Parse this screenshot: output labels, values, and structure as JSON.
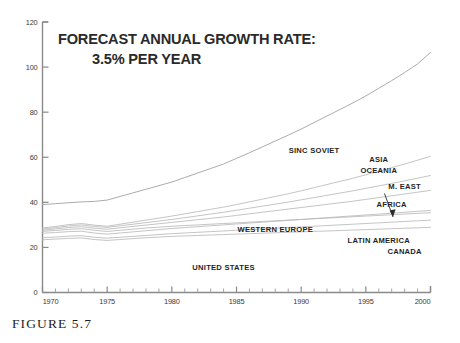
{
  "figure": {
    "caption": "FIGURE 5.7"
  },
  "chart_data": {
    "type": "line",
    "title": "FORECAST ANNUAL GROWTH RATE:",
    "subtitle": "3.5% PER YEAR",
    "xlabel": "",
    "ylabel": "",
    "xlim": [
      1970,
      2000
    ],
    "ylim": [
      0,
      120
    ],
    "grid": false,
    "legend_position": "inline-right",
    "x_ticks_major": [
      1970,
      1975,
      1980,
      1985,
      1990,
      1995,
      2000
    ],
    "x_tick_labels": [
      "1970",
      "1975",
      "1980",
      "1985",
      "1990",
      "1995",
      "2000"
    ],
    "x_minor_tick_interval": 1,
    "y_ticks_major": [
      0,
      20,
      40,
      60,
      80,
      100,
      120
    ],
    "y_tick_labels": [
      "0",
      "20",
      "40",
      "60",
      "80",
      "100",
      "120"
    ],
    "x": [
      1970,
      1971,
      1972,
      1973,
      1974,
      1975,
      1976,
      1977,
      1978,
      1979,
      1980,
      1981,
      1982,
      1983,
      1984,
      1985,
      1986,
      1987,
      1988,
      1989,
      1990,
      1991,
      1992,
      1993,
      1994,
      1995,
      1996,
      1997,
      1998,
      1999,
      2000
    ],
    "series": [
      {
        "name": "SINO SOVIET",
        "label": "SINC SOVIET",
        "values": [
          39,
          39.4,
          39.8,
          40.2,
          40.4,
          41,
          42.6,
          44.2,
          45.8,
          47.4,
          49,
          51,
          53,
          55,
          57,
          59.5,
          62,
          64.6,
          67.2,
          69.8,
          72.5,
          75.4,
          78.3,
          81.2,
          84.1,
          87.2,
          90.6,
          94,
          97.6,
          101.4,
          106.5
        ]
      },
      {
        "name": "ASIA OCEANIA",
        "label": "ASIA\nOCEANIA",
        "values": [
          28.6,
          29.3,
          30.1,
          30.6,
          29.9,
          29.4,
          30.3,
          31.2,
          32.1,
          33,
          33.9,
          34.9,
          35.9,
          36.9,
          37.9,
          39,
          40.2,
          41.4,
          42.6,
          43.8,
          45.1,
          46.5,
          47.9,
          49.3,
          50.7,
          52.2,
          53.8,
          55.4,
          57,
          58.7,
          60.4
        ]
      },
      {
        "name": "MIDDLE EAST",
        "label": "M. EAST",
        "values": [
          28.1,
          28.8,
          29.5,
          30,
          29.3,
          28.9,
          29.6,
          30.3,
          31,
          31.7,
          32.4,
          33.2,
          34,
          34.8,
          35.6,
          36.5,
          37.4,
          38.3,
          39.2,
          40.1,
          41.1,
          42.1,
          43.1,
          44.1,
          45.1,
          46.2,
          47.3,
          48.4,
          49.5,
          50.7,
          51.9
        ]
      },
      {
        "name": "AFRICA",
        "label": "AFRICA",
        "values": [
          27.6,
          28.2,
          28.8,
          29.2,
          28.5,
          28.1,
          28.7,
          29.3,
          29.9,
          30.5,
          31.1,
          31.7,
          32.3,
          32.9,
          33.5,
          34.2,
          34.9,
          35.6,
          36.3,
          37,
          37.7,
          38.4,
          39.1,
          39.8,
          40.5,
          41.3,
          42.1,
          42.9,
          43.7,
          44.5,
          45.3
        ]
      },
      {
        "name": "WESTERN EUROPE",
        "label": "WESTERN EUROPE",
        "values": [
          26.3,
          26.6,
          27,
          27.2,
          26.4,
          25.9,
          26.4,
          26.9,
          27.4,
          27.9,
          28.4,
          28.8,
          29.2,
          29.6,
          30,
          30.4,
          30.8,
          31.2,
          31.6,
          32,
          32.4,
          32.8,
          33.2,
          33.6,
          34,
          34.4,
          34.8,
          35.2,
          35.6,
          36,
          36.4
        ]
      },
      {
        "name": "LATIN AMERICA",
        "label": "LATIN AMERICA",
        "values": [
          24.3,
          24.6,
          25,
          25.2,
          24.5,
          24.1,
          24.5,
          24.9,
          25.3,
          25.7,
          26.1,
          26.4,
          26.7,
          27,
          27.3,
          27.6,
          27.9,
          28.2,
          28.5,
          28.8,
          29.1,
          29.4,
          29.7,
          30,
          30.3,
          30.6,
          30.9,
          31.2,
          31.5,
          31.8,
          32.1
        ]
      },
      {
        "name": "CANADA",
        "label": "CANADA",
        "values": [
          23.4,
          23.7,
          24,
          24.2,
          23.5,
          23.1,
          23.5,
          23.9,
          24.3,
          24.6,
          24.9,
          25.1,
          25.3,
          25.5,
          25.7,
          25.9,
          26.1,
          26.3,
          26.5,
          26.7,
          26.9,
          27.1,
          27.3,
          27.5,
          27.7,
          27.9,
          28.1,
          28.3,
          28.5,
          28.7,
          28.9
        ]
      },
      {
        "name": "UNITED STATES",
        "label": "UNITED STATES",
        "values": [
          27.1,
          27.5,
          28,
          28.3,
          27.6,
          27.1,
          27.6,
          28.1,
          28.6,
          29,
          29.4,
          29.7,
          30,
          30.3,
          30.6,
          30.9,
          31.2,
          31.5,
          31.8,
          32.1,
          32.4,
          32.7,
          33,
          33.3,
          33.6,
          33.9,
          34.2,
          34.5,
          34.8,
          35.1,
          35.4
        ]
      }
    ],
    "annotations": [
      {
        "text": "SINC SOVIET",
        "x": 1991,
        "y": 62
      },
      {
        "text": "ASIA",
        "x": 1996,
        "y": 58
      },
      {
        "text": "OCEANIA",
        "x": 1996,
        "y": 53
      },
      {
        "text": "M. EAST",
        "x": 1998,
        "y": 46
      },
      {
        "text": "AFRICA",
        "x": 1997,
        "y": 38
      },
      {
        "text": "WESTERN EUROPE",
        "x": 1988,
        "y": 27
      },
      {
        "text": "LATIN AMERICA",
        "x": 1996,
        "y": 22
      },
      {
        "text": "CANADA",
        "x": 1998,
        "y": 17
      },
      {
        "text": "UNITED STATES",
        "x": 1984,
        "y": 10
      }
    ]
  }
}
